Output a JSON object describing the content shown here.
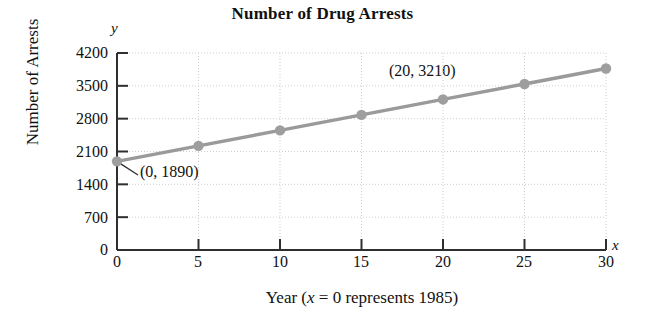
{
  "chart_data": {
    "type": "line",
    "title": "Number of Drug Arrests",
    "xlabel": "Year (x = 0 represents 1985)",
    "xlabel_parts": {
      "prefix": "Year (",
      "var": "x",
      "suffix": " = 0 represents 1985)"
    },
    "ylabel": "Number of Arrests",
    "x_axis_variable": "x",
    "y_axis_variable": "y",
    "x": [
      0,
      5,
      10,
      15,
      20,
      25,
      30
    ],
    "values": [
      1890,
      2220,
      2550,
      2880,
      3210,
      3540,
      3870
    ],
    "xlim": [
      0,
      30
    ],
    "ylim": [
      0,
      4200
    ],
    "xticks": [
      0,
      5,
      10,
      15,
      20,
      25,
      30
    ],
    "xtick_labels": [
      "0",
      "5",
      "10",
      "15",
      "20",
      "25",
      "30"
    ],
    "yticks": [
      0,
      700,
      1400,
      2100,
      2800,
      3500,
      4200
    ],
    "ytick_labels": [
      "0",
      "700",
      "1400",
      "2100",
      "2800",
      "3500",
      "4200"
    ],
    "grid": true,
    "legend": null,
    "annotations": [
      {
        "text": "(0, 1890)",
        "point_x": 0,
        "point_y": 1890
      },
      {
        "text": "(20, 3210)",
        "point_x": 20,
        "point_y": 3210
      }
    ],
    "colors": {
      "line": "#9a9a9a",
      "marker": "#9e9e9e",
      "axis": "#2f2f2f",
      "grid": "#cfcfcf",
      "text": "#111111",
      "background": "#ffffff"
    }
  }
}
